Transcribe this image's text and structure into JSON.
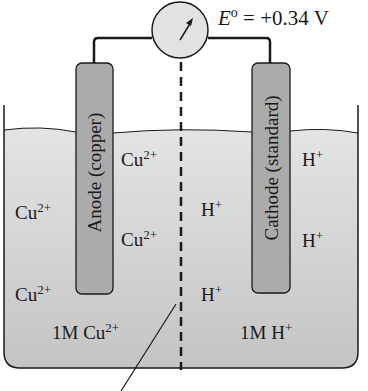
{
  "diagram": {
    "type": "electrochemical-cell",
    "voltmeter": {
      "label_symbol": "E",
      "label_superscript": "o",
      "label_value": "= +0.34 V"
    },
    "electrodes": {
      "anode": {
        "label": "Anode (copper)"
      },
      "cathode": {
        "label": "Cathode (standard)"
      }
    },
    "left_compartment": {
      "ions": [
        {
          "base": "Cu",
          "charge": "2+"
        },
        {
          "base": "Cu",
          "charge": "2+"
        },
        {
          "base": "Cu",
          "charge": "2+"
        },
        {
          "base": "Cu",
          "charge": "2+"
        }
      ],
      "concentration": {
        "base": "1M Cu",
        "charge": "2+"
      }
    },
    "right_compartment": {
      "ions": [
        {
          "base": "H",
          "charge": "+"
        },
        {
          "base": "H",
          "charge": "+"
        },
        {
          "base": "H",
          "charge": "+"
        },
        {
          "base": "H",
          "charge": "+"
        }
      ],
      "concentration": {
        "base": "1M H",
        "charge": "+"
      }
    },
    "colors": {
      "solution": "#d6d6d6",
      "electrode": "#a8a8a8",
      "meter": "#e2e2e2",
      "line": "#1a1a1a"
    }
  }
}
